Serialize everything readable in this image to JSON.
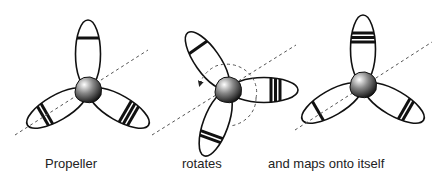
{
  "figure": {
    "captions": [
      "Propeller",
      "rotates",
      "and maps onto itself"
    ],
    "colors": {
      "stroke": "#111111",
      "axis": "#555555",
      "hub_dark": "#111111",
      "hub_light": "#ffffff"
    },
    "propellers": [
      {
        "name": "original",
        "hub": [
          88,
          90
        ],
        "axis": [
          [
            15,
            135
          ],
          [
            148,
            50
          ]
        ],
        "blades": [
          {
            "angle": -90,
            "stripes": 1
          },
          {
            "angle": 150,
            "stripes": 2
          },
          {
            "angle": 30,
            "stripes": 3
          }
        ],
        "rotation_arrow": false
      },
      {
        "name": "rotating",
        "hub": [
          228,
          90
        ],
        "axis": [
          [
            152,
            135
          ],
          [
            296,
            45
          ]
        ],
        "blades": [
          {
            "angle": -125,
            "stripes": 1
          },
          {
            "angle": 0,
            "stripes": 3
          },
          {
            "angle": 110,
            "stripes": 2
          }
        ],
        "rotation_arrow": true
      },
      {
        "name": "mapped",
        "hub": [
          363,
          85
        ],
        "axis": [
          [
            295,
            130
          ],
          [
            432,
            42
          ]
        ],
        "blades": [
          {
            "angle": -90,
            "stripes": 3
          },
          {
            "angle": 150,
            "stripes": 1
          },
          {
            "angle": 30,
            "stripes": 2
          }
        ],
        "rotation_arrow": false
      }
    ]
  }
}
